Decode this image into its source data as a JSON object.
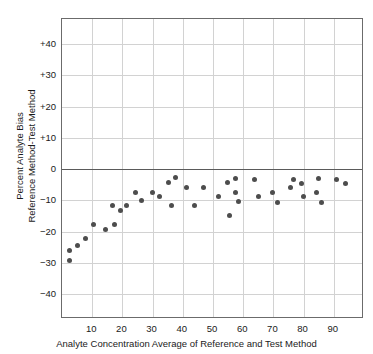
{
  "chart_data": {
    "type": "scatter",
    "title": "",
    "xlabel": "Analyte Concentration Average of Reference and Test Method",
    "ylabel_line1": "Percent Analyte Bias",
    "ylabel_line2": "Reference Method-Test Method",
    "xlim": [
      0,
      100
    ],
    "ylim": [
      -48,
      48
    ],
    "xticks": [
      10,
      20,
      30,
      40,
      50,
      60,
      70,
      80,
      90
    ],
    "xticklabels": [
      "10",
      "20",
      "30",
      "40",
      "50",
      "60",
      "70",
      "80",
      "90"
    ],
    "yticks": [
      40,
      30,
      20,
      10,
      0,
      -10,
      -20,
      -30,
      -40
    ],
    "yticklabels": [
      "+40",
      "+30",
      "+20",
      "+10",
      "0",
      "−10",
      "−20",
      "−30",
      "−40"
    ],
    "grid": true,
    "legend": null,
    "marker_color": "#4d4d4d",
    "zero_line": 0,
    "points": [
      {
        "x": 2.5,
        "y": -29.2
      },
      {
        "x": 2.5,
        "y": -26.0
      },
      {
        "x": 5.2,
        "y": -24.6
      },
      {
        "x": 7.7,
        "y": -22.1
      },
      {
        "x": 10.3,
        "y": -17.6
      },
      {
        "x": 14.3,
        "y": -19.2
      },
      {
        "x": 16.8,
        "y": -11.8
      },
      {
        "x": 17.5,
        "y": -17.6
      },
      {
        "x": 19.5,
        "y": -13.3
      },
      {
        "x": 21.5,
        "y": -11.8
      },
      {
        "x": 24.5,
        "y": -7.4
      },
      {
        "x": 26.3,
        "y": -10.2
      },
      {
        "x": 29.8,
        "y": -7.4
      },
      {
        "x": 32.3,
        "y": -8.9
      },
      {
        "x": 35.3,
        "y": -4.4
      },
      {
        "x": 36.3,
        "y": -11.8
      },
      {
        "x": 37.5,
        "y": -2.8
      },
      {
        "x": 41.3,
        "y": -6.0
      },
      {
        "x": 44.0,
        "y": -11.8
      },
      {
        "x": 46.8,
        "y": -6.0
      },
      {
        "x": 51.8,
        "y": -8.9
      },
      {
        "x": 54.8,
        "y": -4.4
      },
      {
        "x": 55.5,
        "y": -14.8
      },
      {
        "x": 57.3,
        "y": -2.9
      },
      {
        "x": 57.5,
        "y": -7.6
      },
      {
        "x": 58.3,
        "y": -10.4
      },
      {
        "x": 63.8,
        "y": -3.2
      },
      {
        "x": 65.0,
        "y": -8.9
      },
      {
        "x": 69.8,
        "y": -7.6
      },
      {
        "x": 71.3,
        "y": -10.6
      },
      {
        "x": 75.8,
        "y": -6.0
      },
      {
        "x": 76.8,
        "y": -3.2
      },
      {
        "x": 79.3,
        "y": -4.6
      },
      {
        "x": 79.8,
        "y": -8.9
      },
      {
        "x": 84.3,
        "y": -7.6
      },
      {
        "x": 84.8,
        "y": -3.0
      },
      {
        "x": 85.8,
        "y": -10.6
      },
      {
        "x": 90.8,
        "y": -3.2
      },
      {
        "x": 94.0,
        "y": -4.6
      }
    ]
  }
}
